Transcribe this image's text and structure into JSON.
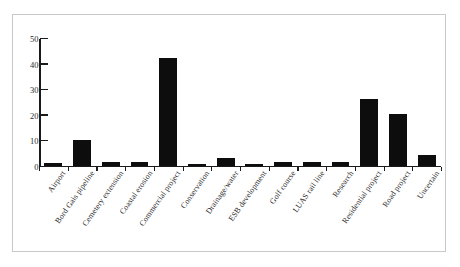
{
  "figure": {
    "border_color": "#c9c9c9",
    "background": "#ffffff",
    "bar_color": "#0d0d0d",
    "axis_color": "#1a1a1a"
  },
  "chart_data": {
    "type": "bar",
    "title": "",
    "subtitle": "",
    "xlabel": "",
    "ylabel": "",
    "ylim": [
      0,
      50
    ],
    "yticks": [
      0,
      10,
      20,
      30,
      40,
      50
    ],
    "ytick_labels": [
      "0",
      "10",
      "20",
      "30",
      "40",
      "50"
    ],
    "grid": false,
    "legend": null,
    "orientation": "vertical",
    "categories": [
      "Airport",
      "Bord Gais pipeline",
      "Cemetery extension",
      "Coastal erosion",
      "Commercial project",
      "Conservation",
      "Drainage/water",
      "ESB development",
      "Golf course",
      "LUAS rail line",
      "Research",
      "Residential project",
      "Road project",
      "Uncertain"
    ],
    "values": [
      1,
      10,
      1.5,
      1.5,
      42,
      0.5,
      3,
      0.5,
      1.5,
      1.5,
      1.5,
      26,
      20,
      4
    ],
    "series": [
      {
        "name": "Count",
        "values": [
          1,
          10,
          1.5,
          1.5,
          42,
          0.5,
          3,
          0.5,
          1.5,
          1.5,
          1.5,
          26,
          20,
          4
        ]
      }
    ]
  }
}
